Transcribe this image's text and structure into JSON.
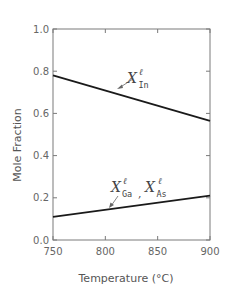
{
  "chart_data": {
    "type": "line",
    "title": "",
    "xlabel": "Temperature (°C)",
    "ylabel": "Mole Fraction",
    "xlim": [
      750,
      900
    ],
    "ylim": [
      0.0,
      1.0
    ],
    "x_ticks": [
      750,
      800,
      850,
      900
    ],
    "y_ticks": [
      0.0,
      0.2,
      0.4,
      0.6,
      0.8,
      1.0
    ],
    "x_tick_labels": [
      "750",
      "800",
      "850",
      "900"
    ],
    "y_tick_labels": [
      "0.0",
      "0.2",
      "0.4",
      "0.6",
      "0.8",
      "1.0"
    ],
    "grid": false,
    "legend": "none (inline annotations with arrows)",
    "series": [
      {
        "name": "X_In^l",
        "label_main": "X",
        "label_sup": "ℓ",
        "label_sub": "In",
        "x": [
          750,
          900
        ],
        "y": [
          0.78,
          0.565
        ]
      },
      {
        "name": "X_Ga^l, X_As^l",
        "label_main": "X",
        "label_sup": "ℓ",
        "label_sub": "Ga",
        "label_sep": ",",
        "label2_main": "X",
        "label2_sup": "ℓ",
        "label2_sub": "As",
        "x": [
          750,
          900
        ],
        "y": [
          0.11,
          0.21
        ]
      }
    ]
  },
  "style": {
    "line_color": "#1a1a1a",
    "axis_color": "#7a7a7a",
    "text_color": "#555555"
  }
}
